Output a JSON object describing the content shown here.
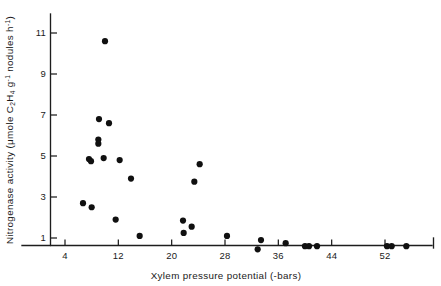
{
  "figure": {
    "background_color": "#ffffff",
    "ink_color": "#1a1a1a",
    "point_color": "#101010"
  },
  "axis_titles": {
    "x": "Xylem pressure potential (-bars)",
    "y_prefix": "Nitrogenase activity (",
    "y_unit_1": "μmole C",
    "y_unit_sub1": "2",
    "y_unit_2": "H",
    "y_unit_sub2": "4",
    "y_unit_3": " g",
    "y_unit_sup1": "-1",
    "y_unit_4": " nodules h",
    "y_unit_sup2": "-1",
    "y_suffix": ")",
    "y_full": "Nitrogenase activity (μmole C2H4 g-1 nodules h-1)"
  },
  "chart_data": {
    "type": "scatter",
    "title": "",
    "xlabel": "Xylem pressure potential (-bars)",
    "ylabel": "Nitrogenase activity (μmole C2H4 g-1 nodules h-1)",
    "xlim": [
      0,
      56
    ],
    "ylim": [
      0,
      11.9
    ],
    "grid": false,
    "legend": false,
    "xticks": [
      4,
      12,
      20,
      28,
      36,
      44,
      52
    ],
    "xtick_labels": [
      "4",
      "12",
      "20",
      "28",
      "36",
      "44",
      "52"
    ],
    "yticks": [
      1,
      3,
      5,
      7,
      9,
      11
    ],
    "ytick_labels": [
      "1",
      "3",
      "5",
      "7",
      "9",
      "11"
    ],
    "marker": "filled-circle",
    "points": [
      {
        "x": 10.0,
        "y": 10.6
      },
      {
        "x": 9.1,
        "y": 6.8
      },
      {
        "x": 10.6,
        "y": 6.6
      },
      {
        "x": 9.0,
        "y": 5.8
      },
      {
        "x": 9.0,
        "y": 5.6
      },
      {
        "x": 7.6,
        "y": 4.85
      },
      {
        "x": 7.9,
        "y": 4.75
      },
      {
        "x": 9.8,
        "y": 4.9
      },
      {
        "x": 12.2,
        "y": 4.8
      },
      {
        "x": 13.9,
        "y": 3.9
      },
      {
        "x": 6.7,
        "y": 2.7
      },
      {
        "x": 8.0,
        "y": 2.5
      },
      {
        "x": 11.6,
        "y": 1.9
      },
      {
        "x": 15.2,
        "y": 1.1
      },
      {
        "x": 24.2,
        "y": 4.6
      },
      {
        "x": 23.4,
        "y": 3.75
      },
      {
        "x": 21.7,
        "y": 1.85
      },
      {
        "x": 23.0,
        "y": 1.55
      },
      {
        "x": 21.8,
        "y": 1.25
      },
      {
        "x": 28.3,
        "y": 1.1
      },
      {
        "x": 33.4,
        "y": 0.9
      },
      {
        "x": 32.9,
        "y": 0.45
      },
      {
        "x": 37.1,
        "y": 0.75
      },
      {
        "x": 40.0,
        "y": 0.6
      },
      {
        "x": 40.6,
        "y": 0.6
      },
      {
        "x": 41.8,
        "y": 0.6
      },
      {
        "x": 52.3,
        "y": 0.6
      },
      {
        "x": 53.0,
        "y": 0.6
      },
      {
        "x": 55.2,
        "y": 0.6
      }
    ]
  }
}
